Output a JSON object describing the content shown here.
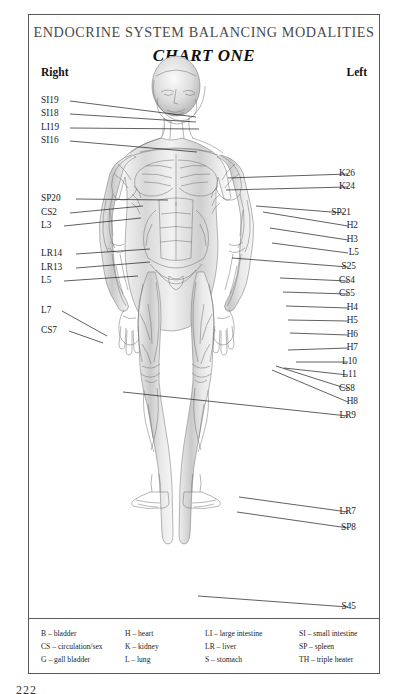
{
  "document": {
    "title": "ENDOCRINE SYSTEM BALANCING MODALITIES",
    "subtitle": "CHART ONE",
    "page_number": "222"
  },
  "headers": {
    "right": "Right",
    "left": "Left"
  },
  "labels_left": [
    {
      "text": "SI19",
      "x": 41,
      "y": 101,
      "lx": 70,
      "ly": 101,
      "tx": 196,
      "ty": 117
    },
    {
      "text": "SI18",
      "x": 41,
      "y": 114,
      "lx": 70,
      "ly": 114,
      "tx": 196,
      "ty": 122
    },
    {
      "text": "LI19",
      "x": 41,
      "y": 128,
      "lx": 70,
      "ly": 128,
      "tx": 199,
      "ty": 129
    },
    {
      "text": "SI16",
      "x": 41,
      "y": 141,
      "lx": 70,
      "ly": 141,
      "tx": 197,
      "ty": 152
    },
    {
      "text": "SP20",
      "x": 41,
      "y": 199,
      "lx": 76,
      "ly": 199,
      "tx": 168,
      "ty": 200
    },
    {
      "text": "CS2",
      "x": 41,
      "y": 213,
      "lx": 70,
      "ly": 213,
      "tx": 143,
      "ty": 206
    },
    {
      "text": "L3",
      "x": 41,
      "y": 226,
      "lx": 64,
      "ly": 226,
      "tx": 141,
      "ty": 218
    },
    {
      "text": "LR14",
      "x": 41,
      "y": 254,
      "lx": 76,
      "ly": 254,
      "tx": 150,
      "ty": 249
    },
    {
      "text": "LR13",
      "x": 41,
      "y": 268,
      "lx": 76,
      "ly": 268,
      "tx": 150,
      "ty": 262
    },
    {
      "text": "L5",
      "x": 41,
      "y": 281,
      "lx": 64,
      "ly": 281,
      "tx": 138,
      "ty": 276
    },
    {
      "text": "L7",
      "x": 41,
      "y": 311,
      "lx": 62,
      "ly": 311,
      "tx": 107,
      "ly2": 0,
      "ty": 336
    },
    {
      "text": "CS7",
      "x": 41,
      "y": 331,
      "lx": 69,
      "ly": 331,
      "tx": 103,
      "ty": 343
    }
  ],
  "labels_right": [
    {
      "text": "K26",
      "x": 355,
      "y": 174,
      "lx": 348,
      "ly": 174,
      "tx": 228,
      "ty": 178
    },
    {
      "text": "K24",
      "x": 355,
      "y": 187,
      "lx": 348,
      "ly": 187,
      "tx": 226,
      "ty": 190
    },
    {
      "text": "SP21",
      "x": 351,
      "y": 213,
      "lx": 344,
      "ly": 213,
      "tx": 256,
      "ty": 206
    },
    {
      "text": "H2",
      "x": 358,
      "y": 226,
      "lx": 348,
      "ly": 226,
      "tx": 263,
      "ty": 212
    },
    {
      "text": "H3",
      "x": 358,
      "y": 240,
      "lx": 348,
      "ly": 240,
      "tx": 270,
      "ty": 228
    },
    {
      "text": "L5",
      "x": 359,
      "y": 253,
      "lx": 348,
      "ly": 253,
      "tx": 272,
      "ty": 243
    },
    {
      "text": "S25",
      "x": 356,
      "y": 267,
      "lx": 348,
      "ly": 267,
      "tx": 232,
      "ty": 258
    },
    {
      "text": "CS4",
      "x": 355,
      "y": 281,
      "lx": 348,
      "ly": 281,
      "tx": 280,
      "ty": 278
    },
    {
      "text": "CS5",
      "x": 355,
      "y": 294,
      "lx": 348,
      "ly": 294,
      "tx": 283,
      "ty": 292
    },
    {
      "text": "H4",
      "x": 358,
      "y": 308,
      "lx": 348,
      "ly": 308,
      "tx": 286,
      "ty": 306
    },
    {
      "text": "H5",
      "x": 358,
      "y": 321,
      "lx": 348,
      "ly": 321,
      "tx": 288,
      "ty": 320
    },
    {
      "text": "H6",
      "x": 358,
      "y": 335,
      "lx": 348,
      "ly": 335,
      "tx": 290,
      "ty": 333
    },
    {
      "text": "H7",
      "x": 358,
      "y": 348,
      "lx": 348,
      "ly": 348,
      "tx": 288,
      "ty": 350
    },
    {
      "text": "L10",
      "x": 357,
      "y": 362,
      "lx": 348,
      "ly": 362,
      "tx": 296,
      "ty": 362
    },
    {
      "text": "L11",
      "x": 357,
      "y": 375,
      "lx": 348,
      "ly": 375,
      "tx": 284,
      "ty": 368
    },
    {
      "text": "CS8",
      "x": 355,
      "y": 389,
      "lx": 348,
      "ly": 389,
      "tx": 276,
      "ty": 366
    },
    {
      "text": "H8",
      "x": 358,
      "y": 402,
      "lx": 348,
      "ly": 402,
      "tx": 272,
      "ty": 370
    },
    {
      "text": "LR9",
      "x": 356,
      "y": 416,
      "lx": 348,
      "ly": 416,
      "tx": 123,
      "ty": 392
    },
    {
      "text": "LR7",
      "x": 356,
      "y": 512,
      "lx": 348,
      "ly": 512,
      "tx": 239,
      "ty": 497
    },
    {
      "text": "SP8",
      "x": 356,
      "y": 528,
      "lx": 348,
      "ly": 528,
      "tx": 237,
      "ty": 512
    },
    {
      "text": "S45",
      "x": 356,
      "y": 607,
      "lx": 348,
      "ly": 607,
      "tx": 198,
      "ty": 596
    }
  ],
  "legend": [
    "B – bladder",
    "H – heart",
    "LI – large intestine",
    "SI – small intestine",
    "CS – circulation/sex",
    "K – kidney",
    "LR – liver",
    "SP – spleen",
    "G – gall bladder",
    "L – lung",
    "S – stomach",
    "TH – triple heater"
  ],
  "colors": {
    "ink": "#1c1c1c",
    "frame": "#5a5a5a",
    "title": "#4a4a4a",
    "figure": "#8d8d8d"
  }
}
